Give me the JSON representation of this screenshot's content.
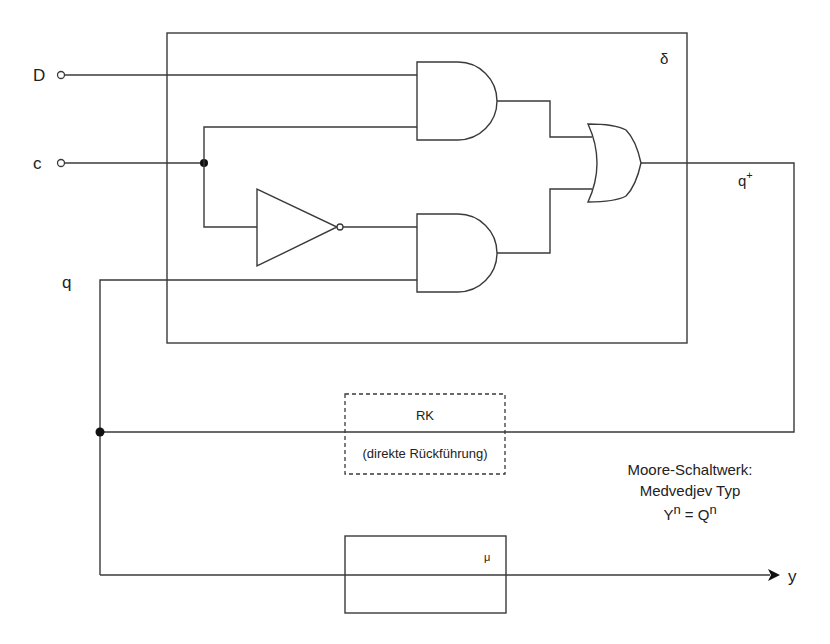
{
  "diagram": {
    "type": "circuit",
    "blocks": {
      "delta": {
        "label": "δ",
        "kind": "transition-logic"
      },
      "rk": {
        "label": "RK",
        "sublabel": "(direkte Rückführung)",
        "style": "dashed"
      },
      "mu": {
        "label": "μ",
        "kind": "output-logic"
      }
    },
    "inputs": {
      "d": {
        "label": "D"
      },
      "c": {
        "label": "c"
      }
    },
    "signals": {
      "q": "q",
      "q_plus_base": "q",
      "q_plus_sup": "+",
      "y": "y"
    },
    "gates": [
      {
        "id": "and1",
        "type": "AND",
        "inputs": [
          "D",
          "c"
        ]
      },
      {
        "id": "not1",
        "type": "NOT",
        "inputs": [
          "c"
        ]
      },
      {
        "id": "and2",
        "type": "AND",
        "inputs": [
          "not c",
          "q"
        ]
      },
      {
        "id": "or1",
        "type": "OR",
        "inputs": [
          "and1",
          "and2"
        ],
        "output": "q+"
      }
    ],
    "annotation": {
      "line1": "Moore-Schaltwerk:",
      "line2": "Medvedjev Typ",
      "eq_y": "Y",
      "eq_y_sup": "n",
      "eq_mid": " = Q",
      "eq_q_sup": "n"
    }
  }
}
